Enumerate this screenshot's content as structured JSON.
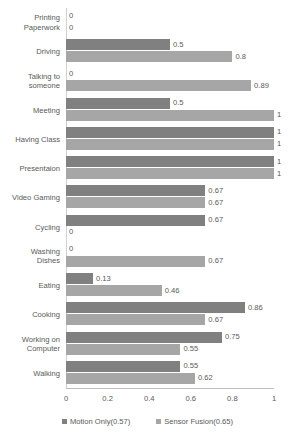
{
  "chart_data": {
    "type": "bar",
    "orientation": "horizontal",
    "title": "",
    "xlabel": "",
    "ylabel": "",
    "xlim": [
      0,
      1
    ],
    "xticks": [
      "0",
      "0.2",
      "0.4",
      "0.6",
      "0.8",
      "1"
    ],
    "grid": false,
    "legend_position": "bottom",
    "categories": [
      "Printing\nPaperwork",
      "Driving",
      "Talking to\nsomeone",
      "Meeting",
      "Having Class",
      "Presentaion",
      "Video Gaming",
      "Cycling",
      "Washing\nDishes",
      "Eating",
      "Cooking",
      "Working on\nComputer",
      "Walking"
    ],
    "series": [
      {
        "name": "Motion Only(0.57)",
        "color": "#808080",
        "values": [
          0,
          0.5,
          0,
          0.5,
          1,
          1,
          0.67,
          0.67,
          0,
          0.13,
          0.86,
          0.75,
          0.55
        ],
        "labels": [
          "0",
          "0.5",
          "0",
          "0.5",
          "1",
          "1",
          "0.67",
          "0.67",
          "0",
          "0.13",
          "0.86",
          "0.75",
          "0.55"
        ]
      },
      {
        "name": "Sensor Fusion(0.65)",
        "color": "#a6a6a6",
        "values": [
          0,
          0.8,
          0.89,
          1,
          1,
          1,
          0.67,
          0,
          0.67,
          0.46,
          0.67,
          0.55,
          0.62
        ],
        "labels": [
          "0",
          "0.8",
          "0.89",
          "1",
          "1",
          "1",
          "0.67",
          "0",
          "0.67",
          "0.46",
          "0.67",
          "0.55",
          "0.62"
        ]
      }
    ]
  }
}
